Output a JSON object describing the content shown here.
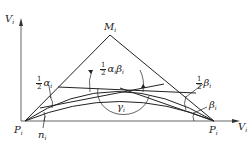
{
  "diagram": {
    "axes": {
      "y_label": "V",
      "y_sub": "i",
      "x_label": "V",
      "x_sub": "i"
    },
    "points": {
      "apex": {
        "label": "M",
        "sub": "i"
      },
      "left_end": {
        "label": "P",
        "sub": "i"
      },
      "right_end": {
        "label": "P",
        "sub": "i"
      }
    },
    "angles": {
      "half_alpha": {
        "num": "1",
        "den": "2",
        "symbol": "α",
        "sub": "i"
      },
      "half_alpha_beta": {
        "num": "1",
        "den": "2",
        "symbol": "α",
        "sub1": "i",
        "symbol2": "β",
        "sub2": "i"
      },
      "half_beta": {
        "num": "1",
        "den": "2",
        "symbol": "β",
        "sub": "i"
      },
      "beta": {
        "symbol": "β",
        "sub": "i"
      },
      "gamma": {
        "symbol": "γ",
        "sub": "i"
      },
      "n": {
        "symbol": "n",
        "sub": "i"
      }
    },
    "colors": {
      "line": "#222222",
      "axis": "#555555",
      "background": "#ffffff"
    }
  }
}
